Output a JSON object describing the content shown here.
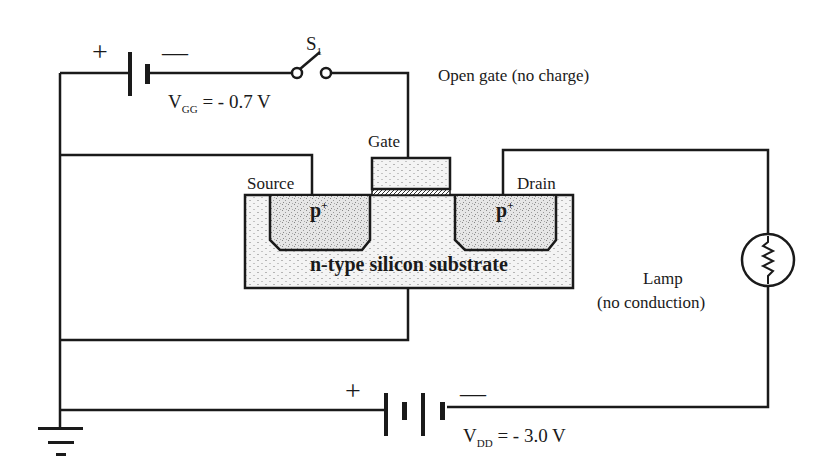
{
  "diagram": {
    "gate_status_label": "Open gate (no charge)",
    "switch": {
      "label": "S",
      "subscript": "1",
      "state": "open"
    },
    "gate_battery": {
      "symbol": "V",
      "subscript": "GG",
      "value": "= - 0.7 V",
      "plus": "+",
      "minus": "—"
    },
    "drain_battery": {
      "symbol": "V",
      "subscript": "DD",
      "value": "= - 3.0 V",
      "plus": "+",
      "minus": "—"
    },
    "terminals": {
      "gate": "Gate",
      "source": "Source",
      "drain": "Drain"
    },
    "regions": {
      "source_region": "p",
      "drain_region": "p",
      "doping_sup": "+",
      "substrate": "n-type silicon substrate"
    },
    "lamp": {
      "label": "Lamp",
      "status": "(no conduction)"
    },
    "colors": {
      "line": "#1a1a1a",
      "fill": "#f2f2f2",
      "background": "#ffffff"
    }
  }
}
